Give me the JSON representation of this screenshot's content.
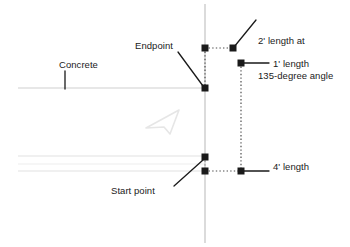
{
  "diagram": {
    "background_color": "#ffffff",
    "labels": {
      "dim_2ft_line1": "2' length at",
      "dim_2ft_line2": "135-degree angle",
      "dim_1ft": "1' length",
      "dim_4ft": "4' length",
      "endpoint": "Endpoint",
      "concrete": "Concrete",
      "start_point": "Start point"
    },
    "colors": {
      "handle_fill": "#1a1a1a",
      "leader_line": "#1a1a1a",
      "construction_dotted": "#555555",
      "reference_line": "#b9b9b9",
      "concrete_line": "#c9c9c9",
      "hatch_line": "#e2e2e2",
      "cursor_outline": "#e8e8e8",
      "text": "#1a1a1a"
    },
    "geometry": {
      "vertical_reference_x": 205,
      "horizontal_concrete_y": 88,
      "handles": [
        {
          "name": "handle-top-left",
          "x": 205,
          "y": 48,
          "size": 7
        },
        {
          "name": "handle-top-right",
          "x": 233,
          "y": 48,
          "size": 7
        },
        {
          "name": "handle-endpoint",
          "x": 205,
          "y": 88,
          "size": 7
        },
        {
          "name": "handle-right-upper",
          "x": 241,
          "y": 63,
          "size": 7
        },
        {
          "name": "handle-start-upper",
          "x": 205,
          "y": 157,
          "size": 7
        },
        {
          "name": "handle-start-lower",
          "x": 205,
          "y": 171,
          "size": 7
        },
        {
          "name": "handle-right-lower",
          "x": 241,
          "y": 171,
          "size": 7
        }
      ]
    }
  }
}
